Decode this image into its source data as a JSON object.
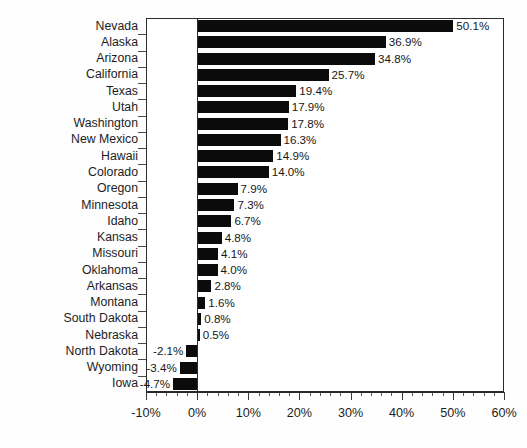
{
  "chart_data": {
    "type": "bar",
    "orientation": "horizontal",
    "title": "",
    "subtitle": "",
    "xlabel": "",
    "ylabel": "",
    "xlim": [
      -10,
      60
    ],
    "ylim": null,
    "grid": false,
    "legend": null,
    "bar_color": "#0b0b0b",
    "axis_color": "#2b2b2b",
    "value_suffix": "%",
    "xtick_labels": [
      "-10%",
      "0%",
      "10%",
      "20%",
      "30%",
      "40%",
      "50%",
      "60%"
    ],
    "xtick_values": [
      -10,
      0,
      10,
      20,
      30,
      40,
      50,
      60
    ],
    "minor_tick_step": 2,
    "categories": [
      "Nevada",
      "Alaska",
      "Arizona",
      "California",
      "Texas",
      "Utah",
      "Washington",
      "New Mexico",
      "Hawaii",
      "Colorado",
      "Oregon",
      "Minnesota",
      "Idaho",
      "Kansas",
      "Missouri",
      "Oklahoma",
      "Arkansas",
      "Montana",
      "South Dakota",
      "Nebraska",
      "North Dakota",
      "Wyoming",
      "Iowa"
    ],
    "values": [
      50.1,
      36.9,
      34.8,
      25.7,
      19.4,
      17.9,
      17.8,
      16.3,
      14.9,
      14.0,
      7.9,
      7.3,
      6.7,
      4.8,
      4.1,
      4.0,
      2.8,
      1.6,
      0.8,
      0.5,
      -2.1,
      -3.4,
      -4.7
    ],
    "data_labels": [
      "50.1%",
      "36.9%",
      "34.8%",
      "25.7%",
      "19.4%",
      "17.9%",
      "17.8%",
      "16.3%",
      "14.9%",
      "14.0%",
      "7.9%",
      "7.3%",
      "6.7%",
      "4.8%",
      "4.1%",
      "4.0%",
      "2.8%",
      "1.6%",
      "0.8%",
      "0.5%",
      "-2.1%",
      "-3.4%",
      "-4.7%"
    ]
  }
}
